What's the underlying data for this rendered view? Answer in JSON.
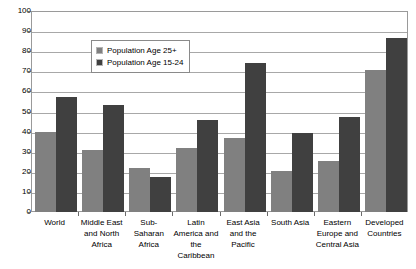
{
  "chart_data": {
    "type": "bar",
    "title": "",
    "xlabel": "",
    "ylabel": "Attainment Rate",
    "ylim": [
      0,
      100
    ],
    "ytick_step": 10,
    "yticks": [
      100,
      90,
      80,
      70,
      60,
      50,
      40,
      30,
      20,
      10,
      0
    ],
    "grid": true,
    "legend_position": "inside-upper-left",
    "categories": [
      "World",
      "Middle East and North Africa",
      "Sub-Saharan Africa",
      "Latin America and the Caribbean",
      "East Asia and the Pacific",
      "South Asia",
      "Eastern Europe and Central Asia",
      "Developed Countries"
    ],
    "category_lines": [
      [
        "World"
      ],
      [
        "Middle East",
        "and North",
        "Africa"
      ],
      [
        "Sub-",
        "Saharan",
        "Africa"
      ],
      [
        "Latin",
        "America and",
        "the",
        "Caribbean"
      ],
      [
        "East Asia",
        "and the",
        "Pacific"
      ],
      [
        "South Asia"
      ],
      [
        "Eastern",
        "Europe and",
        "Central Asia"
      ],
      [
        "Developed",
        "Countries"
      ]
    ],
    "series": [
      {
        "name": "Population Age 25+",
        "color": "#808080",
        "values": [
          40,
          31,
          22,
          32,
          37,
          20.5,
          25.5,
          70.5
        ]
      },
      {
        "name": "Population Age 15-24",
        "color": "#404040",
        "values": [
          57,
          53,
          17.5,
          46,
          74,
          39.5,
          47.5,
          86.5
        ]
      }
    ]
  },
  "legend": {
    "items": [
      {
        "label": "Population Age 25+",
        "color": "#808080"
      },
      {
        "label": "Population Age 15-24",
        "color": "#404040"
      }
    ]
  },
  "axes": {
    "y_title": "Attainment Rate"
  },
  "top_caption": ""
}
